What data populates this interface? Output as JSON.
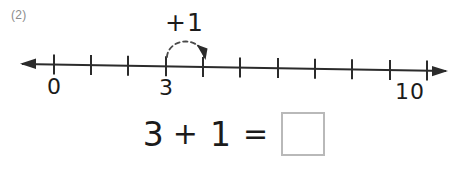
{
  "problem": {
    "number_label": "(2)"
  },
  "number_line": {
    "tick_count": 11,
    "labels": [
      {
        "value": "0",
        "tick_index": 0
      },
      {
        "value": "3",
        "tick_index": 3
      },
      {
        "value": "10",
        "tick_index": 10
      }
    ],
    "left_arrow": "left-arrowhead",
    "right_arrow": "right-arrowhead",
    "hop": {
      "label": "+1",
      "from_tick": 3,
      "to_tick": 4,
      "style": "dashed-arc-with-arrowhead"
    }
  },
  "equation": {
    "first_term": "3",
    "operator": "+",
    "second_term": "1",
    "equals": "=",
    "answer": ""
  },
  "colors": {
    "ink": "#1b1b1b",
    "problem_number": "#8c8c8c",
    "answer_box_border": "#b9b9b9",
    "background": "#ffffff"
  }
}
